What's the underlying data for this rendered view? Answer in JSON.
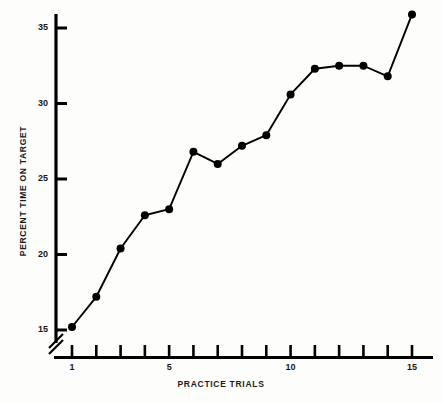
{
  "chart_data": {
    "type": "line",
    "title": "",
    "xlabel": "PRACTICE TRIALS",
    "ylabel": "PERCENT TIME ON TARGET",
    "x": [
      1,
      2,
      3,
      4,
      5,
      6,
      7,
      8,
      9,
      10,
      11,
      12,
      13,
      14,
      15
    ],
    "values": [
      15.2,
      17.2,
      20.4,
      22.6,
      23.0,
      26.8,
      26.0,
      27.2,
      27.9,
      30.6,
      32.3,
      32.5,
      32.5,
      31.8,
      35.9
    ],
    "series": [
      {
        "name": "percent time on target",
        "values": [
          15.2,
          17.2,
          20.4,
          22.6,
          23.0,
          26.8,
          26.0,
          27.2,
          27.9,
          30.6,
          32.3,
          32.5,
          32.5,
          31.8,
          35.9
        ],
        "marker": "filled-circle",
        "color": "#000000"
      }
    ],
    "xlim": [
      0.55,
      15.85
    ],
    "ylim": [
      14.3,
      36.6
    ],
    "xticks": [
      1,
      2,
      3,
      4,
      5,
      6,
      7,
      8,
      9,
      10,
      11,
      12,
      13,
      14,
      15
    ],
    "xticklabels": [
      "1",
      "",
      "",
      "",
      "5",
      "",
      "",
      "",
      "",
      "10",
      "",
      "",
      "",
      "",
      "15"
    ],
    "yticks": [
      15,
      20,
      25,
      30,
      35
    ],
    "yticklabels": [
      "15",
      "20",
      "25",
      "30",
      "35"
    ],
    "grid": false,
    "legend": false,
    "legend_position": "none",
    "axis_break": {
      "axis": "y",
      "symbol": "double-slash",
      "below_value": 15
    },
    "spines": [
      "left",
      "bottom"
    ],
    "annotations": []
  },
  "axes": {
    "y_tick_labels": [
      {
        "label": "35",
        "value": 35
      },
      {
        "label": "30",
        "value": 30
      },
      {
        "label": "25",
        "value": 25
      },
      {
        "label": "20",
        "value": 20
      },
      {
        "label": "15",
        "value": 15
      }
    ],
    "x_tick_labels": [
      {
        "label": "1",
        "value": 1
      },
      {
        "label": "5",
        "value": 5
      },
      {
        "label": "10",
        "value": 10
      },
      {
        "label": "15",
        "value": 15
      }
    ]
  },
  "style": {
    "line_color": "#000000",
    "marker_color": "#000000",
    "axis_color": "#000000",
    "background": "#fdfdfc",
    "text_color": "#161616"
  }
}
